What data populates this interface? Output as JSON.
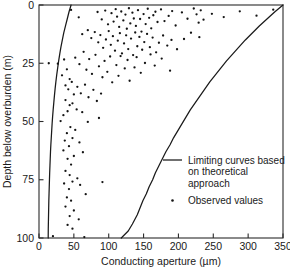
{
  "chart_data": {
    "type": "scatter",
    "title": "",
    "xlabel": "Conducting aperture (µm)",
    "ylabel": "Depth below overburden (m)",
    "xlim": [
      0,
      350
    ],
    "ylim": [
      0,
      100
    ],
    "y_inverted": true,
    "grid": false,
    "xticks": [
      0,
      50,
      100,
      150,
      200,
      250,
      300,
      350
    ],
    "xticklabels": [
      "0",
      "50",
      "100",
      "150",
      "200",
      "250",
      "300",
      "350"
    ],
    "yticks": [
      0,
      25,
      50,
      75,
      100
    ],
    "yticklabels": [
      "0",
      "25",
      "50",
      "75",
      "100"
    ],
    "legend": {
      "position": "inside-right-lower",
      "entries": [
        {
          "marker": "line",
          "label_lines": [
            "Limiting curves based",
            "on theoretical",
            "approach"
          ]
        },
        {
          "marker": "dot",
          "label_lines": [
            "Observed values"
          ]
        }
      ]
    },
    "series": [
      {
        "name": "Lower limiting curve (theoretical)",
        "type": "line",
        "points": [
          [
            46,
            0
          ],
          [
            43,
            3
          ],
          [
            40.5,
            6
          ],
          [
            38,
            9
          ],
          [
            35.5,
            12
          ],
          [
            33.5,
            15
          ],
          [
            31.5,
            18
          ],
          [
            29.8,
            21
          ],
          [
            28.2,
            24
          ],
          [
            26.8,
            27
          ],
          [
            25.4,
            30
          ],
          [
            24.2,
            33
          ],
          [
            23.1,
            36
          ],
          [
            22.1,
            39
          ],
          [
            21.2,
            42
          ],
          [
            20.3,
            45
          ],
          [
            19.5,
            48
          ],
          [
            18.8,
            51
          ],
          [
            18.2,
            54
          ],
          [
            17.6,
            57
          ],
          [
            17.0,
            60
          ],
          [
            16.5,
            63
          ],
          [
            16.1,
            66
          ],
          [
            15.7,
            69
          ],
          [
            15.3,
            72
          ],
          [
            15.0,
            75
          ],
          [
            14.7,
            78
          ],
          [
            14.4,
            81
          ],
          [
            14.1,
            84
          ],
          [
            13.9,
            87
          ],
          [
            13.7,
            90
          ],
          [
            13.5,
            93
          ],
          [
            13.3,
            96
          ],
          [
            13.2,
            100
          ]
        ]
      },
      {
        "name": "Upper limiting curve (theoretical)",
        "type": "line",
        "points": [
          [
            350,
            0
          ],
          [
            338,
            3
          ],
          [
            327,
            6
          ],
          [
            316,
            9
          ],
          [
            306,
            12
          ],
          [
            296,
            15
          ],
          [
            287,
            18
          ],
          [
            278,
            21
          ],
          [
            269,
            24
          ],
          [
            261,
            27
          ],
          [
            253,
            30
          ],
          [
            245,
            33
          ],
          [
            238,
            36
          ],
          [
            231,
            39
          ],
          [
            224,
            42
          ],
          [
            217,
            45
          ],
          [
            211,
            48
          ],
          [
            205,
            51
          ],
          [
            199,
            54
          ],
          [
            193,
            57
          ],
          [
            188,
            60
          ],
          [
            182,
            63
          ],
          [
            177,
            66
          ],
          [
            172,
            69
          ],
          [
            167,
            72
          ],
          [
            163,
            75
          ],
          [
            158,
            78
          ],
          [
            154,
            81
          ],
          [
            149,
            84
          ],
          [
            145,
            87
          ],
          [
            141,
            90
          ],
          [
            134,
            94
          ],
          [
            128,
            97
          ],
          [
            118,
            100
          ]
        ]
      },
      {
        "name": "Observed values",
        "type": "scatter",
        "points": [
          [
            46,
            2.1
          ],
          [
            57,
            5.3
          ],
          [
            84,
            3.0
          ],
          [
            90,
            6.2
          ],
          [
            95,
            2.4
          ],
          [
            99,
            8.3
          ],
          [
            104,
            3.5
          ],
          [
            107,
            7.1
          ],
          [
            110,
            1.8
          ],
          [
            112,
            5.0
          ],
          [
            115,
            9.4
          ],
          [
            118,
            2.8
          ],
          [
            121,
            6.6
          ],
          [
            124,
            4.1
          ],
          [
            126,
            10.2
          ],
          [
            129,
            1.4
          ],
          [
            131,
            7.9
          ],
          [
            134,
            3.3
          ],
          [
            136,
            5.8
          ],
          [
            139,
            9.0
          ],
          [
            142,
            2.2
          ],
          [
            145,
            6.0
          ],
          [
            147,
            11.4
          ],
          [
            150,
            3.9
          ],
          [
            153,
            8.2
          ],
          [
            156,
            1.6
          ],
          [
            158,
            5.5
          ],
          [
            161,
            10.0
          ],
          [
            164,
            4.4
          ],
          [
            167,
            2.9
          ],
          [
            170,
            7.3
          ],
          [
            175,
            1.9
          ],
          [
            180,
            6.9
          ],
          [
            186,
            4.7
          ],
          [
            191,
            2.6
          ],
          [
            196,
            8.8
          ],
          [
            205,
            3.2
          ],
          [
            213,
            5.9
          ],
          [
            222,
            1.5
          ],
          [
            226,
            4.0
          ],
          [
            229,
            7.6
          ],
          [
            232,
            2.3
          ],
          [
            236,
            6.3
          ],
          [
            248,
            3.8
          ],
          [
            265,
            5.2
          ],
          [
            288,
            2.7
          ],
          [
            312,
            4.6
          ],
          [
            336,
            2.0
          ],
          [
            62,
            12.5
          ],
          [
            70,
            10.8
          ],
          [
            75,
            14.2
          ],
          [
            80,
            11.6
          ],
          [
            85,
            16.0
          ],
          [
            88,
            12.9
          ],
          [
            92,
            18.4
          ],
          [
            96,
            14.8
          ],
          [
            100,
            11.2
          ],
          [
            103,
            17.1
          ],
          [
            106,
            13.4
          ],
          [
            109,
            19.6
          ],
          [
            113,
            15.3
          ],
          [
            116,
            12.1
          ],
          [
            119,
            20.8
          ],
          [
            122,
            16.5
          ],
          [
            125,
            13.0
          ],
          [
            128,
            18.9
          ],
          [
            132,
            14.4
          ],
          [
            135,
            21.5
          ],
          [
            138,
            11.8
          ],
          [
            141,
            17.7
          ],
          [
            144,
            13.7
          ],
          [
            148,
            19.2
          ],
          [
            151,
            15.9
          ],
          [
            155,
            12.4
          ],
          [
            159,
            18.1
          ],
          [
            163,
            14.0
          ],
          [
            168,
            20.3
          ],
          [
            172,
            16.2
          ],
          [
            178,
            13.1
          ],
          [
            184,
            17.4
          ],
          [
            190,
            15.0
          ],
          [
            198,
            19.0
          ],
          [
            208,
            14.6
          ],
          [
            218,
            11.9
          ],
          [
            230,
            13.8
          ],
          [
            52,
            22.6
          ],
          [
            58,
            25.4
          ],
          [
            64,
            20.1
          ],
          [
            68,
            27.8
          ],
          [
            72,
            23.2
          ],
          [
            76,
            29.6
          ],
          [
            81,
            21.4
          ],
          [
            86,
            26.3
          ],
          [
            91,
            31.0
          ],
          [
            94,
            24.0
          ],
          [
            98,
            28.7
          ],
          [
            102,
            22.1
          ],
          [
            105,
            33.2
          ],
          [
            111,
            25.8
          ],
          [
            114,
            30.4
          ],
          [
            117,
            21.9
          ],
          [
            123,
            27.2
          ],
          [
            127,
            23.6
          ],
          [
            130,
            32.5
          ],
          [
            137,
            26.8
          ],
          [
            140,
            22.4
          ],
          [
            146,
            29.1
          ],
          [
            152,
            24.9
          ],
          [
            160,
            21.2
          ],
          [
            166,
            26.0
          ],
          [
            176,
            23.0
          ],
          [
            188,
            28.2
          ],
          [
            14,
            25.0
          ],
          [
            27,
            25.2
          ],
          [
            36,
            23.4
          ],
          [
            40,
            27.6
          ],
          [
            33,
            30.2
          ],
          [
            44,
            31.8
          ],
          [
            38,
            34.5
          ],
          [
            42,
            36.2
          ],
          [
            47,
            33.0
          ],
          [
            50,
            38.4
          ],
          [
            55,
            35.1
          ],
          [
            60,
            37.9
          ],
          [
            66,
            34.2
          ],
          [
            71,
            39.6
          ],
          [
            78,
            36.4
          ],
          [
            83,
            41.2
          ],
          [
            89,
            38.0
          ],
          [
            38,
            40.8
          ],
          [
            44,
            43.0
          ],
          [
            41,
            45.6
          ],
          [
            48,
            42.2
          ],
          [
            35,
            47.3
          ],
          [
            54,
            44.8
          ],
          [
            62,
            46.0
          ],
          [
            86,
            48.5
          ],
          [
            70,
            50.2
          ],
          [
            31,
            49.8
          ],
          [
            45,
            52.4
          ],
          [
            40,
            55.0
          ],
          [
            52,
            53.6
          ],
          [
            37,
            58.2
          ],
          [
            48,
            57.1
          ],
          [
            43,
            60.6
          ],
          [
            58,
            59.0
          ],
          [
            35,
            62.4
          ],
          [
            50,
            64.8
          ],
          [
            63,
            63.2
          ],
          [
            41,
            66.0
          ],
          [
            46,
            68.5
          ],
          [
            38,
            71.2
          ],
          [
            44,
            73.0
          ],
          [
            55,
            74.4
          ],
          [
            48,
            75.8
          ],
          [
            36,
            76.6
          ],
          [
            59,
            77.2
          ],
          [
            43,
            79.0
          ],
          [
            91,
            76.0
          ],
          [
            67,
            81.2
          ],
          [
            40,
            82.6
          ],
          [
            46,
            84.0
          ],
          [
            38,
            86.5
          ],
          [
            50,
            88.2
          ],
          [
            44,
            90.6
          ],
          [
            57,
            92.0
          ],
          [
            41,
            94.4
          ],
          [
            48,
            96.0
          ],
          [
            20,
            99.2
          ],
          [
            65,
            99.6
          ]
        ]
      }
    ]
  }
}
